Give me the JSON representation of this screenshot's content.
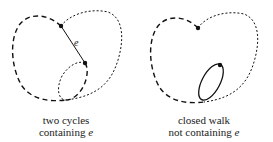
{
  "left_figure": {
    "caption_line1": "two cycles",
    "caption_line2_prefix": "containing ",
    "caption_line2_var": "e",
    "edge_label": "e"
  },
  "right_figure": {
    "caption_line1": "closed walk",
    "caption_line2_prefix": "not containing ",
    "caption_line2_var": "e"
  },
  "colors": {
    "stroke": "#111111",
    "background": "#ffffff"
  }
}
